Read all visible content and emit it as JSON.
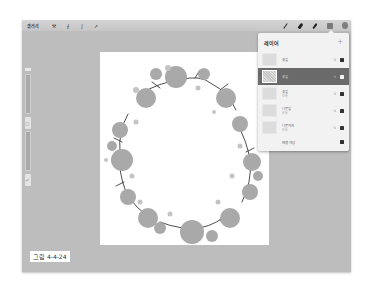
{
  "toolbar": {
    "gallery_label": "갤러리",
    "left_tools": [
      {
        "icon": "wrench-icon",
        "glyph": "⚒"
      },
      {
        "icon": "magic-wand-icon",
        "glyph": "∮"
      },
      {
        "icon": "selection-icon",
        "glyph": "ʃ"
      },
      {
        "icon": "transform-icon",
        "glyph": "➚"
      }
    ],
    "right_tools": [
      "brush-icon",
      "smudge-icon",
      "eraser-icon",
      "layers-icon",
      "color-icon"
    ]
  },
  "layers_panel": {
    "title": "레이어",
    "add_label": "+",
    "layers": [
      {
        "name": "꽃잎",
        "mode": "",
        "blend": "N",
        "visible": true,
        "active": false
      },
      {
        "name": "꽃잎",
        "mode": "",
        "blend": "N",
        "visible": true,
        "active": true
      },
      {
        "name": "꽃잎",
        "mode": "보통",
        "blend": "N",
        "visible": true,
        "active": false
      },
      {
        "name": "나뭇잎",
        "mode": "보통",
        "blend": "N",
        "visible": true,
        "active": false
      },
      {
        "name": "나뭇가지",
        "mode": "보통",
        "blend": "N",
        "visible": true,
        "active": false
      }
    ],
    "background_label": "배경 색상"
  },
  "sidebar": {
    "modify_button": "□",
    "undo_button": "↶"
  },
  "caption": "그림 4-4-24"
}
